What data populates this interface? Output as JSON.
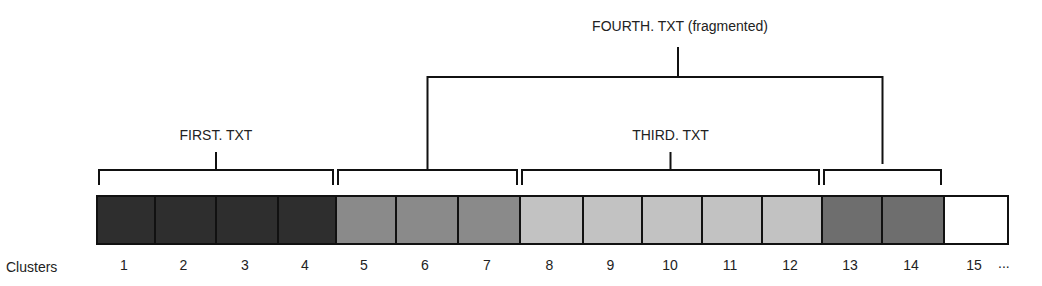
{
  "row_label": "Clusters",
  "ellipsis": "...",
  "clusters": [
    {
      "n": "1",
      "file": "FIRST.TXT",
      "color": "#2e2e2e"
    },
    {
      "n": "2",
      "file": "FIRST.TXT",
      "color": "#2e2e2e"
    },
    {
      "n": "3",
      "file": "FIRST.TXT",
      "color": "#2e2e2e"
    },
    {
      "n": "4",
      "file": "FIRST.TXT",
      "color": "#2e2e2e"
    },
    {
      "n": "5",
      "file": "FOURTH.TXT",
      "color": "#8a8a8a"
    },
    {
      "n": "6",
      "file": "FOURTH.TXT",
      "color": "#8a8a8a"
    },
    {
      "n": "7",
      "file": "FOURTH.TXT",
      "color": "#8a8a8a"
    },
    {
      "n": "8",
      "file": "THIRD.TXT",
      "color": "#c2c2c2"
    },
    {
      "n": "9",
      "file": "THIRD.TXT",
      "color": "#c2c2c2"
    },
    {
      "n": "10",
      "file": "THIRD.TXT",
      "color": "#c2c2c2"
    },
    {
      "n": "11",
      "file": "THIRD.TXT",
      "color": "#c2c2c2"
    },
    {
      "n": "12",
      "file": "THIRD.TXT",
      "color": "#c2c2c2"
    },
    {
      "n": "13",
      "file": "FOURTH.TXT",
      "color": "#6e6e6e"
    },
    {
      "n": "14",
      "file": "FOURTH.TXT",
      "color": "#6e6e6e"
    },
    {
      "n": "15",
      "file": "",
      "color": "#ffffff"
    }
  ],
  "brackets": [
    {
      "id": "first",
      "label": "FIRST. TXT",
      "from": 1,
      "to": 4
    },
    {
      "id": "fourth-a",
      "label": "",
      "from": 5,
      "to": 7
    },
    {
      "id": "third",
      "label": "THIRD. TXT",
      "from": 8,
      "to": 12
    },
    {
      "id": "fourth-b",
      "label": "",
      "from": 13,
      "to": 14
    }
  ],
  "fragmented_label": "FOURTH. TXT (fragmented)"
}
